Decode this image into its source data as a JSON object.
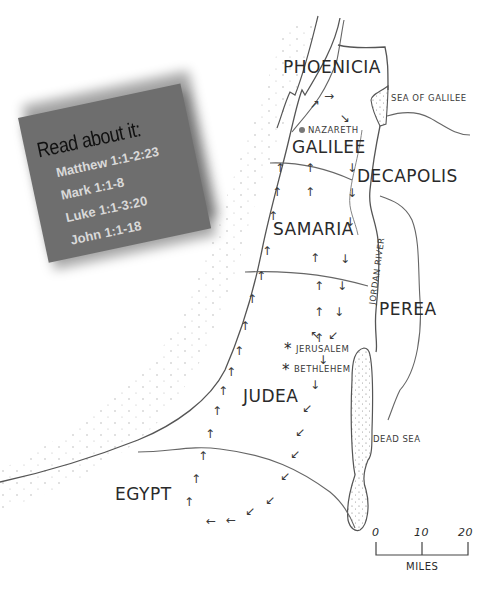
{
  "card": {
    "title": "Read about it:",
    "references": [
      "Matthew 1:1-2:23",
      "Mark 1:1-8",
      "Luke 1:1-3:20",
      "John 1:1-18"
    ],
    "background": "#6e6e6e",
    "text_color": "#d9d9d9"
  },
  "regions": {
    "phoenicia": "PHOENICIA",
    "galilee": "GALILEE",
    "decapolis": "DECAPOLIS",
    "samaria": "SAMARIA",
    "perea": "PEREA",
    "judea": "JUDEA",
    "egypt": "EGYPT"
  },
  "places": {
    "nazareth": "NAZARETH",
    "jerusalem": "JERUSALEM",
    "bethlehem": "BETHLEHEM",
    "sea_of_galilee": "SEA OF GALILEE",
    "dead_sea": "DEAD SEA",
    "jordan_river": "JORDAN RIVER"
  },
  "markers": {
    "city_dot_color": "#777777",
    "star_symbol": "*",
    "arrow_up": "↑",
    "arrow_down": "↓",
    "arrow_left": "←",
    "arrow_upleft": "↖",
    "arrow_downleft": "↙",
    "arrow_upright": "↗",
    "arrow_right": "→",
    "arrow_downright": "↘"
  },
  "scale": {
    "ticks": [
      "0",
      "10",
      "20"
    ],
    "unit": "MILES"
  }
}
